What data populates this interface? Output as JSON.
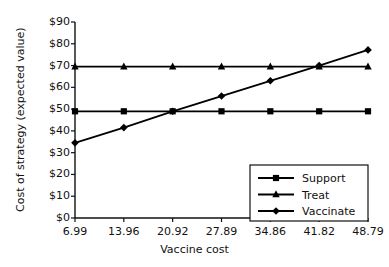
{
  "chart_data": {
    "type": "line",
    "title": "",
    "xlabel": "Vaccine cost",
    "ylabel": "Cost of strategy (expected value)",
    "categories": [
      "6.99",
      "13.96",
      "20.92",
      "27.89",
      "34.86",
      "41.82",
      "48.79"
    ],
    "x": [
      6.99,
      13.96,
      20.92,
      27.89,
      34.86,
      41.82,
      48.79
    ],
    "xlim": [
      6.99,
      48.79
    ],
    "ylim": [
      0,
      90
    ],
    "ytick_labels": [
      "$0",
      "$10",
      "$20",
      "$30",
      "$40",
      "$50",
      "$60",
      "$70",
      "$80",
      "$90"
    ],
    "ytick_values": [
      0,
      10,
      20,
      30,
      40,
      50,
      60,
      70,
      80,
      90
    ],
    "grid": false,
    "legend_position": "lower right",
    "series": [
      {
        "name": "Support",
        "marker": "square",
        "color": "#000000",
        "values": [
          49,
          49,
          49,
          49,
          49,
          49,
          49
        ]
      },
      {
        "name": "Treat",
        "marker": "triangle",
        "color": "#000000",
        "values": [
          69.5,
          69.5,
          69.5,
          69.5,
          69.5,
          69.5,
          69.5
        ]
      },
      {
        "name": "Vaccinate",
        "marker": "diamond",
        "color": "#000000",
        "values": [
          34.5,
          41.5,
          49,
          56,
          63,
          70,
          77.2
        ]
      }
    ]
  },
  "legend": {
    "items": [
      {
        "label": "Support"
      },
      {
        "label": "Treat"
      },
      {
        "label": "Vaccinate"
      }
    ]
  }
}
